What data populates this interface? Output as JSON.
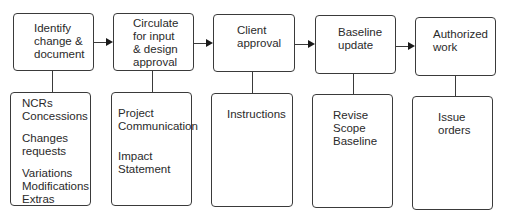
{
  "steps": [
    {
      "title": [
        "Identify",
        "change &",
        "document"
      ],
      "details": [
        [
          "NCRs",
          "Concessions"
        ],
        [
          "Changes",
          "requests"
        ],
        [
          "Variations",
          "Modifications",
          "Extras"
        ]
      ]
    },
    {
      "title": [
        "Circulate",
        "for input",
        "& design",
        "approval"
      ],
      "details": [
        [
          "Project",
          "Communication"
        ],
        [
          "Impact",
          "Statement"
        ]
      ]
    },
    {
      "title": [
        "Client",
        "approval"
      ],
      "details": [
        [
          "Instructions"
        ]
      ]
    },
    {
      "title": [
        "Baseline",
        "update"
      ],
      "details": [
        [
          "Revise",
          "Scope",
          "Baseline"
        ]
      ]
    },
    {
      "title": [
        "Authorized",
        "work"
      ],
      "details": [
        [
          "Issue",
          "orders"
        ]
      ]
    }
  ]
}
